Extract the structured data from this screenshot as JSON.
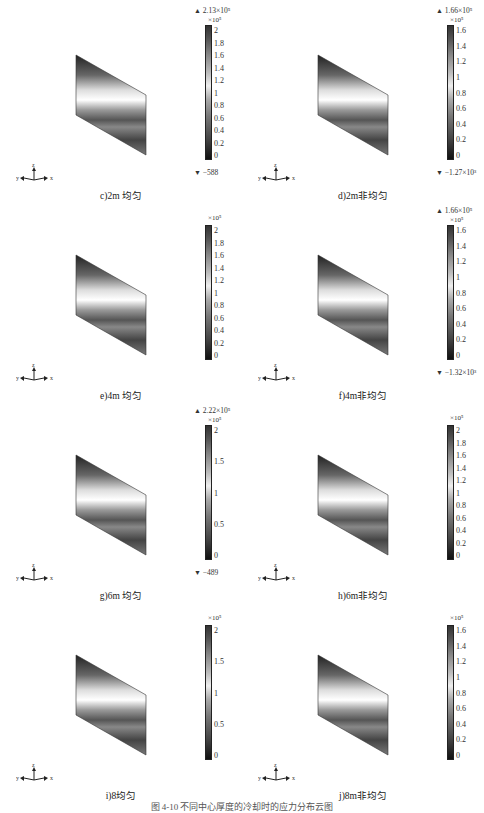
{
  "figure": {
    "caption": "图 4-10  不同中心厚度的冷却时的应力分布云图",
    "panels": [
      {
        "id": "c",
        "label": "c)2m 均匀",
        "max": "2.13×10⁵",
        "min": "−588",
        "unit": "×10⁵",
        "ticks": [
          "2",
          "1.8",
          "1.6",
          "1.4",
          "1.2",
          "1",
          "0.8",
          "0.6",
          "0.4",
          "0.2",
          "0"
        ]
      },
      {
        "id": "d",
        "label": "d)2m非均匀",
        "max": "1.66×10⁵",
        "min": "−1.27×10³",
        "unit": "×10⁵",
        "ticks": [
          "1.6",
          "1.4",
          "1.2",
          "1",
          "0.8",
          "0.6",
          "0.4",
          "0.2",
          "0"
        ]
      },
      {
        "id": "e",
        "label": "e)4m 均匀",
        "max": "",
        "min": "",
        "unit": "×10⁵",
        "ticks": [
          "2",
          "1.8",
          "1.6",
          "1.4",
          "1.2",
          "1",
          "0.8",
          "0.6",
          "0.4",
          "0.2",
          "0"
        ]
      },
      {
        "id": "f",
        "label": "f)4m非均匀",
        "max": "1.66×10⁵",
        "min": "−1.32×10³",
        "unit": "×10⁵",
        "ticks": [
          "1.6",
          "1.4",
          "1.2",
          "1",
          "0.8",
          "0.6",
          "0.4",
          "0.2",
          "0"
        ]
      },
      {
        "id": "g",
        "label": "g)6m 均匀",
        "max": "2.22×10⁵",
        "min": "−489",
        "unit": "×10⁵",
        "ticks": [
          "2",
          "1.5",
          "1",
          "0.5",
          "0"
        ]
      },
      {
        "id": "h",
        "label": "h)6m非均匀",
        "max": "",
        "min": "",
        "unit": "×10⁵",
        "ticks": [
          "2",
          "1.8",
          "1.6",
          "1.4",
          "1.2",
          "1",
          "0.8",
          "0.6",
          "0.4",
          "0.2",
          "0"
        ]
      },
      {
        "id": "i",
        "label": "i)8均匀",
        "max": "",
        "min": "",
        "unit": "×10⁵",
        "ticks": [
          "2",
          "1.5",
          "1",
          "0.5",
          "0"
        ]
      },
      {
        "id": "j",
        "label": "j)8m非均匀",
        "max": "",
        "min": "",
        "unit": "×10⁵",
        "ticks": [
          "1.6",
          "1.4",
          "1.2",
          "1",
          "0.8",
          "0.6",
          "0.4",
          "0.2",
          "0"
        ]
      }
    ],
    "axis_labels": {
      "x": "x",
      "y": "y",
      "z": "z"
    },
    "max_marker": "▲",
    "min_marker": "▼"
  }
}
